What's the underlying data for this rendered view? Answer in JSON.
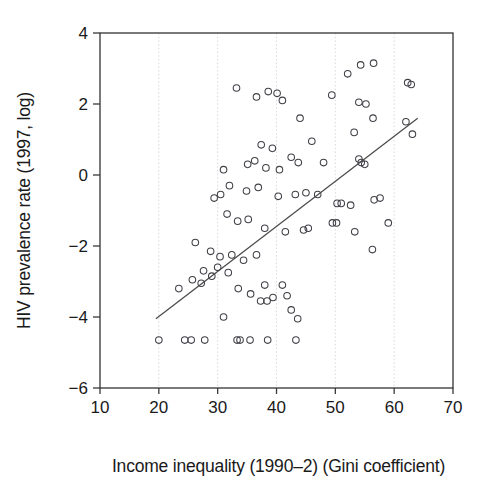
{
  "chart_data": {
    "type": "scatter",
    "title": "",
    "xlabel": "Income inequality (1990–2) (Gini coefficient)",
    "ylabel": "HIV prevalence rate (1997, log)",
    "xlim": [
      10,
      70
    ],
    "ylim": [
      -6,
      4
    ],
    "xticks": [
      10,
      20,
      30,
      40,
      50,
      60,
      70
    ],
    "xtick_labels": [
      "10",
      "20",
      "30",
      "40",
      "50",
      "60",
      "70"
    ],
    "yticks": [
      -6,
      -4,
      -2,
      0,
      2,
      4
    ],
    "ytick_labels": [
      "−6",
      "−4",
      "−2",
      "0",
      "2",
      "4"
    ],
    "grid": "vertical-dotted-at-20-30-40-50-60",
    "gridlines_x": [
      20,
      30,
      40,
      50,
      60
    ],
    "legend": null,
    "marker_style": "open-circle",
    "series": [
      {
        "name": "Countries",
        "points": [
          [
            33.2,
            2.45
          ],
          [
            36.6,
            2.2
          ],
          [
            38.6,
            2.35
          ],
          [
            40.1,
            2.3
          ],
          [
            41.0,
            2.1
          ],
          [
            44.0,
            1.6
          ],
          [
            49.4,
            2.25
          ],
          [
            52.1,
            2.85
          ],
          [
            54.3,
            3.1
          ],
          [
            56.5,
            3.15
          ],
          [
            54.0,
            2.05
          ],
          [
            55.2,
            2.0
          ],
          [
            56.4,
            1.6
          ],
          [
            62.3,
            2.6
          ],
          [
            62.9,
            2.55
          ],
          [
            59.0,
            -1.35
          ],
          [
            37.4,
            0.85
          ],
          [
            39.3,
            0.75
          ],
          [
            43.7,
            0.35
          ],
          [
            36.3,
            0.4
          ],
          [
            35.1,
            0.3
          ],
          [
            38.2,
            0.2
          ],
          [
            40.5,
            0.15
          ],
          [
            42.5,
            0.5
          ],
          [
            46.0,
            0.95
          ],
          [
            48.0,
            0.35
          ],
          [
            53.2,
            1.2
          ],
          [
            54.0,
            0.45
          ],
          [
            54.4,
            0.35
          ],
          [
            55.0,
            0.3
          ],
          [
            62.0,
            1.5
          ],
          [
            63.1,
            1.15
          ],
          [
            31.0,
            0.15
          ],
          [
            32.0,
            -0.3
          ],
          [
            34.9,
            -0.45
          ],
          [
            30.5,
            -0.55
          ],
          [
            36.9,
            -0.35
          ],
          [
            40.3,
            -0.6
          ],
          [
            43.2,
            -0.55
          ],
          [
            45.0,
            -0.5
          ],
          [
            47.0,
            -0.55
          ],
          [
            50.3,
            -0.8
          ],
          [
            51.0,
            -0.8
          ],
          [
            52.6,
            -0.85
          ],
          [
            56.6,
            -0.7
          ],
          [
            57.6,
            -0.65
          ],
          [
            29.4,
            -0.65
          ],
          [
            31.6,
            -1.1
          ],
          [
            33.4,
            -1.3
          ],
          [
            35.2,
            -1.25
          ],
          [
            38.0,
            -1.5
          ],
          [
            41.5,
            -1.6
          ],
          [
            44.6,
            -1.55
          ],
          [
            45.4,
            -1.5
          ],
          [
            49.5,
            -1.35
          ],
          [
            50.2,
            -1.35
          ],
          [
            53.3,
            -1.6
          ],
          [
            56.3,
            -2.1
          ],
          [
            26.2,
            -1.9
          ],
          [
            28.8,
            -2.15
          ],
          [
            30.4,
            -2.3
          ],
          [
            32.4,
            -2.25
          ],
          [
            34.4,
            -2.4
          ],
          [
            36.6,
            -2.25
          ],
          [
            30.0,
            -2.6
          ],
          [
            31.8,
            -2.75
          ],
          [
            27.6,
            -2.7
          ],
          [
            29.0,
            -2.85
          ],
          [
            25.7,
            -2.95
          ],
          [
            23.4,
            -3.2
          ],
          [
            27.2,
            -3.05
          ],
          [
            33.5,
            -3.2
          ],
          [
            35.6,
            -3.35
          ],
          [
            38.0,
            -3.1
          ],
          [
            39.4,
            -3.45
          ],
          [
            37.3,
            -3.55
          ],
          [
            38.4,
            -3.55
          ],
          [
            41.0,
            -3.1
          ],
          [
            41.8,
            -3.4
          ],
          [
            42.5,
            -3.8
          ],
          [
            31.0,
            -4.0
          ],
          [
            43.6,
            -4.05
          ],
          [
            20.0,
            -4.65
          ],
          [
            24.4,
            -4.65
          ],
          [
            25.5,
            -4.65
          ],
          [
            27.8,
            -4.65
          ],
          [
            33.3,
            -4.65
          ],
          [
            33.8,
            -4.65
          ],
          [
            35.5,
            -4.65
          ],
          [
            38.5,
            -4.65
          ],
          [
            43.3,
            -4.65
          ]
        ]
      }
    ],
    "trendline": {
      "label": "regression line",
      "x_start": 19.5,
      "y_start": -4.05,
      "x_end": 64.0,
      "y_end": 1.6
    }
  }
}
